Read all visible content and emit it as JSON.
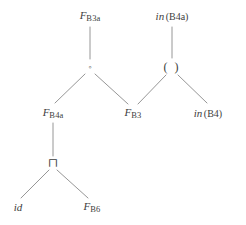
{
  "diagram": {
    "background_color": "#ffffff",
    "edge_color": "#8a8a8a",
    "text_color": "#3d3d3d",
    "width": 246,
    "height": 225,
    "nodes": [
      {
        "id": "f_b3a",
        "name": "node-f-b3a",
        "kind": "function-symbol",
        "var": "F",
        "sub": "B3a",
        "text": "F B3a",
        "x": 90,
        "y": 16
      },
      {
        "id": "in_b4a",
        "name": "node-in-b4a",
        "kind": "in-term",
        "op": "in",
        "arg": "(B4a)",
        "text": "in(B4a)",
        "x": 172,
        "y": 16
      },
      {
        "id": "compose",
        "name": "node-compose-operator",
        "kind": "operator",
        "symbol": "◦",
        "text": "◦",
        "x": 90,
        "y": 67
      },
      {
        "id": "apply",
        "name": "node-apply-operator",
        "kind": "operator",
        "symbol": "( )",
        "text": "( )",
        "x": 172,
        "y": 67
      },
      {
        "id": "f_b4a",
        "name": "node-f-b4a",
        "kind": "function-symbol",
        "var": "F",
        "sub": "B4a",
        "text": "F B4a",
        "x": 53,
        "y": 113
      },
      {
        "id": "f_b3",
        "name": "node-f-b3",
        "kind": "function-symbol",
        "var": "F",
        "sub": "B3",
        "text": "F B3",
        "x": 133,
        "y": 113
      },
      {
        "id": "in_b4",
        "name": "node-in-b4",
        "kind": "in-term",
        "op": "in",
        "arg": "(B4)",
        "text": "in(B4)",
        "x": 208,
        "y": 113
      },
      {
        "id": "meet",
        "name": "node-meet-operator",
        "kind": "operator",
        "symbol": "⊓",
        "text": "⊓",
        "x": 53,
        "y": 163
      },
      {
        "id": "id",
        "name": "node-identity",
        "kind": "identifier",
        "label": "id",
        "text": "id",
        "x": 18,
        "y": 207
      },
      {
        "id": "f_b6",
        "name": "node-f-b6",
        "kind": "function-symbol",
        "var": "F",
        "sub": "B6",
        "text": "F B6",
        "x": 92,
        "y": 207
      }
    ],
    "edges": [
      {
        "name": "edge-f-b3a-to-compose",
        "from": "f_b3a",
        "to": "compose",
        "x1": 90,
        "y1": 27,
        "x2": 90,
        "y2": 59
      },
      {
        "name": "edge-in-b4a-to-apply",
        "from": "in_b4a",
        "to": "apply",
        "x1": 172,
        "y1": 27,
        "x2": 172,
        "y2": 58
      },
      {
        "name": "edge-compose-to-f-b4a",
        "from": "compose",
        "to": "f_b4a",
        "x1": 85,
        "y1": 74,
        "x2": 55,
        "y2": 103
      },
      {
        "name": "edge-compose-to-f-b3",
        "from": "compose",
        "to": "f_b3",
        "x1": 95,
        "y1": 74,
        "x2": 128,
        "y2": 104
      },
      {
        "name": "edge-apply-to-f-b3",
        "from": "apply",
        "to": "f_b3",
        "x1": 166,
        "y1": 75,
        "x2": 138,
        "y2": 104
      },
      {
        "name": "edge-apply-to-in-b4",
        "from": "apply",
        "to": "in_b4",
        "x1": 178,
        "y1": 75,
        "x2": 207,
        "y2": 103
      },
      {
        "name": "edge-f-b4a-to-meet",
        "from": "f_b4a",
        "to": "meet",
        "x1": 53,
        "y1": 123,
        "x2": 53,
        "y2": 156
      },
      {
        "name": "edge-meet-to-id",
        "from": "meet",
        "to": "id",
        "x1": 49,
        "y1": 170,
        "x2": 21,
        "y2": 198
      },
      {
        "name": "edge-meet-to-f-b6",
        "from": "meet",
        "to": "f_b6",
        "x1": 57,
        "y1": 170,
        "x2": 88,
        "y2": 198
      }
    ]
  }
}
